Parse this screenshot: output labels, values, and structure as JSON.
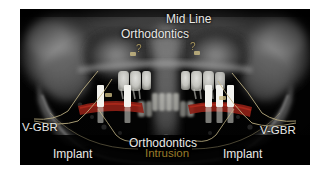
{
  "figure": {
    "type": "panoramic-dental-radiograph",
    "modality": "Panoramic radiograph (OPG)",
    "plate_background": "#000000",
    "page_background": "#ffffff"
  },
  "annotations": {
    "mid_line": {
      "label": "Mid Line",
      "color": "#e9e9e6",
      "position": "top-center-right"
    },
    "orthodontics_top": {
      "label": "Orthodontics",
      "color": "#e9e9e6",
      "position": "top-center"
    },
    "question_mark_left": {
      "label": "?",
      "color": "#c9b26a",
      "position": "upper-left-of-midline"
    },
    "question_mark_right": {
      "label": "?",
      "color": "#c9b26a",
      "position": "upper-right-of-midline"
    },
    "vgbr_left": {
      "label": "V-GBR",
      "color": "#e9e9e6",
      "position": "left-margin"
    },
    "vgbr_right": {
      "label": "V-GBR",
      "color": "#e9e9e6",
      "position": "right-margin"
    },
    "orthodontics_bottom": {
      "label": "Orthodontics",
      "color": "#e9e9e6",
      "position": "bottom-center"
    },
    "intrusion": {
      "label": "Intrusion",
      "color": "#9a7c2a",
      "position": "bottom-center-below-orthodontics"
    },
    "implant_left": {
      "label": "Implant",
      "color": "#e9e9e6",
      "position": "bottom-left"
    },
    "implant_right": {
      "label": "Implant",
      "color": "#e9e9e6",
      "position": "bottom-right"
    }
  },
  "overlay_graphics": {
    "bone_graft_band_color": "#8d1f16",
    "implant_fixture_color": "#f2f2ee",
    "leader_arc_color": "#c2b486",
    "implant_count_left": 2,
    "implant_count_right": 3,
    "leader_arc_count": 4
  }
}
